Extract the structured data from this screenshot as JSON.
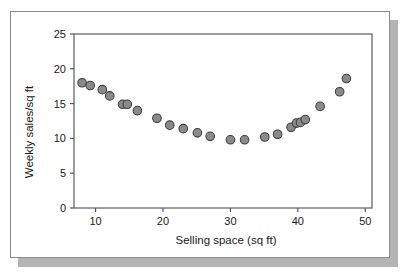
{
  "figure": {
    "name": "scatter-plot-figure",
    "background_color": "#ffffff",
    "border_color": "#8c8c8c",
    "shadow_color": "#b4b4b4"
  },
  "chart_data": {
    "type": "scatter",
    "title": "",
    "xlabel": "Selling space (sq ft)",
    "ylabel": "Weekly sales/sq ft",
    "xlim": [
      6.8,
      51.0
    ],
    "ylim": [
      0,
      25
    ],
    "xticks": [
      10,
      20,
      30,
      40,
      50
    ],
    "xtick_labels": [
      "10",
      "20",
      "30",
      "40",
      "50"
    ],
    "yticks": [
      0,
      5,
      10,
      15,
      20,
      25
    ],
    "ytick_labels": [
      "0",
      "5",
      "10",
      "15",
      "20",
      "25"
    ],
    "grid": false,
    "legend": null,
    "marker": {
      "shape": "circle",
      "fill_color": "#8a8a8a",
      "edge_color": "#3c3c3c",
      "size_px": 4.3
    },
    "n_points": 28,
    "x": [
      8.0,
      9.2,
      11.0,
      12.1,
      14.0,
      14.7,
      16.2,
      19.1,
      21.0,
      23.0,
      25.1,
      27.0,
      30.0,
      32.1,
      35.1,
      37.0,
      39.0,
      40.0,
      40.4,
      41.1,
      43.3,
      46.2,
      47.2,
      10.9,
      15.0,
      13.9,
      39.4,
      41.0
    ],
    "y": [
      18.0,
      17.6,
      17.0,
      16.1,
      14.9,
      14.9,
      14.0,
      12.9,
      11.9,
      11.4,
      10.8,
      10.3,
      9.8,
      9.8,
      10.2,
      10.6,
      11.6,
      12.2,
      12.2,
      12.7,
      14.6,
      16.7,
      18.6,
      17.0,
      14.9,
      14.9,
      11.6,
      12.7
    ],
    "points": [
      {
        "x": 8.0,
        "y": 18.0
      },
      {
        "x": 9.2,
        "y": 17.6
      },
      {
        "x": 11.0,
        "y": 17.0
      },
      {
        "x": 12.1,
        "y": 16.1
      },
      {
        "x": 14.0,
        "y": 14.9
      },
      {
        "x": 14.7,
        "y": 14.9
      },
      {
        "x": 16.2,
        "y": 14.0
      },
      {
        "x": 19.1,
        "y": 12.9
      },
      {
        "x": 21.0,
        "y": 11.9
      },
      {
        "x": 23.0,
        "y": 11.4
      },
      {
        "x": 25.1,
        "y": 10.8
      },
      {
        "x": 27.0,
        "y": 10.3
      },
      {
        "x": 30.0,
        "y": 9.8
      },
      {
        "x": 32.1,
        "y": 9.8
      },
      {
        "x": 35.1,
        "y": 10.2
      },
      {
        "x": 37.0,
        "y": 10.6
      },
      {
        "x": 39.0,
        "y": 11.6
      },
      {
        "x": 39.8,
        "y": 12.2
      },
      {
        "x": 40.4,
        "y": 12.3
      },
      {
        "x": 41.1,
        "y": 12.7
      },
      {
        "x": 43.3,
        "y": 14.6
      },
      {
        "x": 46.2,
        "y": 16.7
      },
      {
        "x": 47.2,
        "y": 18.6
      }
    ]
  }
}
